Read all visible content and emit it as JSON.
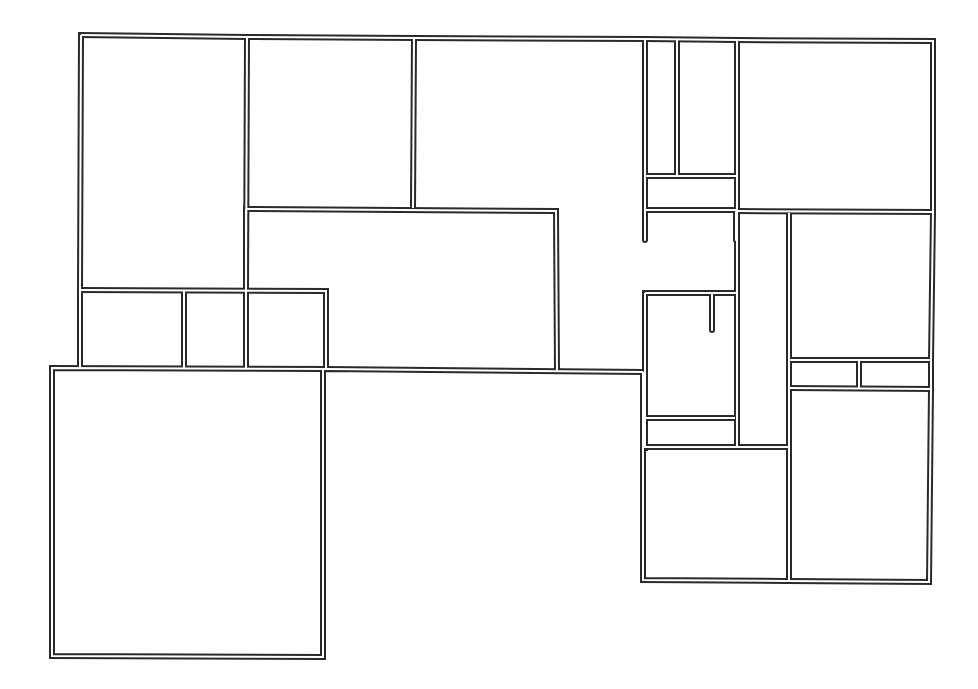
{
  "diagram": {
    "type": "floor-plan",
    "style": "double-line walls",
    "colors": {
      "wall": "#2a2a2a",
      "background": "#ffffff"
    },
    "walls": [
      {
        "d": "M81 35 L247 37 L414 38 L645 39 L737 40 L933 41 L933 212 L931 361 L931 389 L929 582 L787 581 L643 580 L643 448 L643 372"
      },
      {
        "d": "M643 372 L326 369 L52 368 L52 656 L323 657 L323 369"
      },
      {
        "d": "M81 35 L80 290 L80 368"
      },
      {
        "d": "M247 37 L246 289"
      },
      {
        "d": "M414 38 L413 208"
      },
      {
        "d": "M246 209 L556 211 L557 371"
      },
      {
        "d": "M80 290 L326 291 L326 369"
      },
      {
        "d": "M184 291 L184 368"
      },
      {
        "d": "M246 209 L246 368"
      },
      {
        "d": "M737 40 L737 212 L737 447"
      },
      {
        "d": "M737 211 L933 212"
      },
      {
        "d": "M645 176 L737 176"
      },
      {
        "d": "M645 210 L737 210"
      },
      {
        "d": "M677 40 L677 176"
      },
      {
        "d": "M789 213 L789 580"
      },
      {
        "d": "M789 360 L931 360"
      },
      {
        "d": "M789 388 L931 389"
      },
      {
        "d": "M859 360 L859 388"
      },
      {
        "d": "M645 293 L737 293"
      },
      {
        "d": "M645 293 L645 448"
      },
      {
        "d": "M645 418 L735 418"
      },
      {
        "d": "M645 447 L789 447"
      }
    ],
    "stubs": [
      {
        "d": "M645 40 L645 240"
      },
      {
        "d": "M736 212 L736 240"
      },
      {
        "d": "M712 293 L712 330"
      }
    ]
  }
}
